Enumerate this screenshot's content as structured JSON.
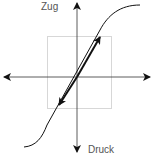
{
  "diagram": {
    "labels": {
      "top": "Zug",
      "bottom": "Druck"
    },
    "colors": {
      "line": "#111111",
      "box": "#999999",
      "text": "#555555"
    }
  }
}
